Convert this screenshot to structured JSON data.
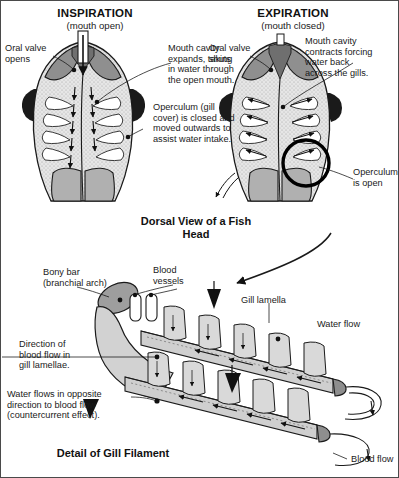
{
  "diagram": {
    "title_left": "INSPIRATION",
    "subtitle_left": "(mouth open)",
    "title_right": "EXPIRATION",
    "subtitle_right": "(mouth closed)",
    "caption_top": "Dorsal View of\na Fish Head",
    "caption_bottom": "Detail of Gill Filament"
  },
  "labels": {
    "oral_valve_opens": "Oral valve\nopens",
    "mouth_cavity_expands": "Mouth cavity\nexpands, taking\nin water through\nthe open mouth.",
    "operculum_closed": "Operculum (gill\ncover) is closed and\nmoved outwards to\nassist water intake.",
    "oral_valve_shuts": "Oral valve\nshuts",
    "mouth_cavity_contracts": "Mouth cavity\ncontracts forcing\nwater back\nacross the gills.",
    "operculum_open": "Operculum\nis open",
    "bony_bar": "Bony bar\n(branchial arch)",
    "blood_vessels": "Blood\nvessels",
    "gill_lamella": "Gill lamella",
    "water_flow": "Water flow",
    "blood_flow": "Blood flow",
    "direction_blood_flow": "Direction of\nblood flow in\ngill lamellae.",
    "countercurrent": "Water flows in opposite\ndirection to blood flow\n(countercurrent effect)."
  },
  "colors": {
    "outline": "#1a1a1a",
    "body_gray": "#b3b3b3",
    "dark_gray": "#8c8c8c",
    "cavity": "#e2e2e2",
    "light": "#dcdcdc",
    "white": "#ffffff",
    "text": "#1a1a1a"
  }
}
